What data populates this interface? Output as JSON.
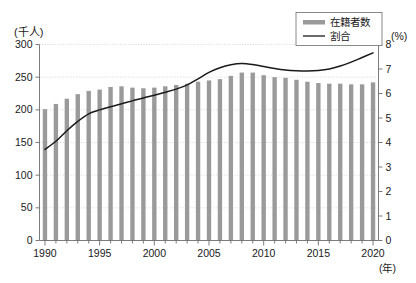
{
  "chart_data": {
    "type": "bar",
    "title": "",
    "subtitle": "",
    "xlabel": "(年)",
    "ylabel": "(千人)",
    "y2label": "(%)",
    "grid": true,
    "legend_position": "top-right",
    "xlim": [
      1990,
      2020
    ],
    "ylim": [
      0,
      300
    ],
    "y2lim": [
      0,
      8
    ],
    "x_tick_labels": [
      "1990",
      "1995",
      "2000",
      "2005",
      "2010",
      "2015",
      "2020"
    ],
    "x_tick_values": [
      1990,
      1995,
      2000,
      2005,
      2010,
      2015,
      2020
    ],
    "y_tick_labels": [
      "0",
      "50",
      "100",
      "150",
      "200",
      "250",
      "300"
    ],
    "y_tick_values": [
      0,
      50,
      100,
      150,
      200,
      250,
      300
    ],
    "y2_tick_labels": [
      "0",
      "1",
      "2",
      "3",
      "4",
      "5",
      "6",
      "7",
      "8"
    ],
    "y2_tick_values": [
      0,
      1,
      2,
      3,
      4,
      5,
      6,
      7,
      8
    ],
    "categories": [
      1990,
      1991,
      1992,
      1993,
      1994,
      1995,
      1996,
      1997,
      1998,
      1999,
      2000,
      2001,
      2002,
      2003,
      2004,
      2005,
      2006,
      2007,
      2008,
      2009,
      2010,
      2011,
      2012,
      2013,
      2014,
      2015,
      2016,
      2017,
      2018,
      2019,
      2020
    ],
    "series": [
      {
        "name": "在籍者数",
        "kind": "bar",
        "axis": "left",
        "unit": "千人",
        "color": "#9a9a9a",
        "values": [
          201,
          209,
          217,
          224,
          229,
          231,
          235,
          236,
          234,
          233,
          234,
          236,
          238,
          240,
          243,
          245,
          247,
          252,
          257,
          257,
          253,
          250,
          249,
          246,
          243,
          241,
          240,
          240,
          239,
          239,
          242
        ]
      },
      {
        "name": "割合",
        "kind": "line",
        "axis": "right",
        "unit": "%",
        "color": "#1a1a1a",
        "values": [
          3.72,
          4.05,
          4.48,
          4.86,
          5.17,
          5.33,
          5.46,
          5.58,
          5.7,
          5.82,
          5.93,
          6.05,
          6.18,
          6.35,
          6.6,
          6.86,
          7.05,
          7.17,
          7.22,
          7.18,
          7.1,
          7.02,
          6.96,
          6.93,
          6.92,
          6.94,
          7.0,
          7.12,
          7.28,
          7.47,
          7.66
        ]
      }
    ]
  },
  "legend": {
    "items": [
      {
        "label": "在籍者数",
        "marker": "bar-swatch",
        "color": "#9a9a9a"
      },
      {
        "label": "割合",
        "marker": "line-swatch",
        "color": "#1a1a1a"
      }
    ]
  }
}
